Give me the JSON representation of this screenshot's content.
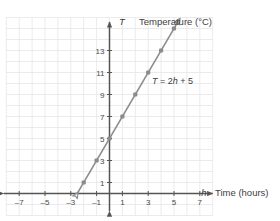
{
  "chart_data": {
    "type": "line",
    "title": "Temperature (°C)",
    "xlabel": "Time (hours)",
    "ylabel": "Temperature (°C)",
    "x_variable": "h",
    "y_variable": "T",
    "equation": "T = 2h + 5",
    "equation_parts": {
      "lhs": "T",
      "op": " = 2",
      "var": "h",
      "rhs": " + 5"
    },
    "x": [
      -2,
      -1,
      0,
      1,
      2,
      3,
      4,
      5
    ],
    "values": [
      1,
      3,
      5,
      7,
      9,
      11,
      13,
      15
    ],
    "xlim": [
      -8,
      8
    ],
    "ylim": [
      -1.5,
      16
    ],
    "xticks": [
      -7,
      -5,
      -3,
      -1,
      1,
      3,
      5,
      7
    ],
    "xtick_labels": [
      "–7",
      "–5",
      "–3",
      "–1",
      "1",
      "3",
      "5",
      "7"
    ],
    "yticks": [
      1,
      3,
      5,
      7,
      9,
      11,
      13
    ],
    "ytick_labels": [
      "1",
      "3",
      "5",
      "7",
      "9",
      "11",
      "13"
    ],
    "grid": true,
    "grid_step": 1,
    "legend": "none",
    "slope": 2,
    "intercept": 5,
    "line_arrow_start": true,
    "line_arrow_end": true,
    "colors": {
      "line": "#8c8c8c",
      "marker": "#8c8c8c",
      "axis": "#555555",
      "grid": "#e6e6ea",
      "text": "#3a3a3a",
      "background": "#ffffff"
    }
  },
  "labels": {
    "y_axis_var": "T",
    "y_axis_title": "Temperature (°C)",
    "x_axis_var": "h",
    "x_axis_title": "Time (hours)"
  }
}
